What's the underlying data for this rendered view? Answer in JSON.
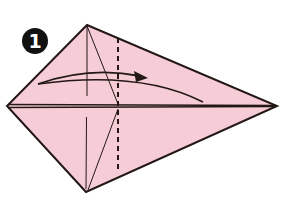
{
  "step": {
    "number": "1",
    "badge_color": "#111111"
  },
  "diagram": {
    "paper_color": "#f6ccd6",
    "line_color": "#231815",
    "vertices": {
      "top": [
        87,
        25
      ],
      "left": [
        7,
        106
      ],
      "bottom": [
        86,
        192
      ],
      "right": [
        277,
        106
      ]
    },
    "valley_fold_x": 118,
    "arrow": "fold-over arrow from left point toward right"
  }
}
